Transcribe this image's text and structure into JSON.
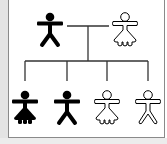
{
  "diagram": {
    "type": "pedigree",
    "colors": {
      "affected": "#000000",
      "unaffected_fill": "#ffffff",
      "stroke": "#000000",
      "line": "#333333",
      "frame": "#8a8a8a",
      "side_strip": "#e4e4e4"
    },
    "parents": [
      {
        "id": "father",
        "sex": "male",
        "status": "affected",
        "x": 50,
        "y": 30
      },
      {
        "id": "mother",
        "sex": "female",
        "status": "unaffected",
        "x": 125,
        "y": 30
      }
    ],
    "children": [
      {
        "id": "child-1",
        "sex": "female",
        "status": "affected",
        "x": 25,
        "y": 108
      },
      {
        "id": "child-2",
        "sex": "male",
        "status": "affected",
        "x": 67,
        "y": 108
      },
      {
        "id": "child-3",
        "sex": "female",
        "status": "unaffected",
        "x": 107,
        "y": 108
      },
      {
        "id": "child-4",
        "sex": "male",
        "status": "unaffected",
        "x": 148,
        "y": 108
      }
    ],
    "legend": []
  }
}
